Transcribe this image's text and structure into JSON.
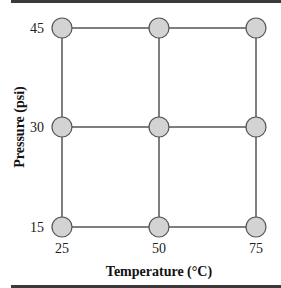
{
  "diagram": {
    "type": "factorial-design-grid",
    "x_axis": {
      "label": "Temperature (°C)",
      "ticks": [
        "25",
        "50",
        "75"
      ]
    },
    "y_axis": {
      "label": "Pressure (psi)",
      "ticks": [
        "15",
        "30",
        "45"
      ]
    },
    "points": [
      {
        "temperature": 25,
        "pressure": 15
      },
      {
        "temperature": 50,
        "pressure": 15
      },
      {
        "temperature": 75,
        "pressure": 15
      },
      {
        "temperature": 25,
        "pressure": 30
      },
      {
        "temperature": 50,
        "pressure": 30
      },
      {
        "temperature": 75,
        "pressure": 30
      },
      {
        "temperature": 25,
        "pressure": 45
      },
      {
        "temperature": 50,
        "pressure": 45
      },
      {
        "temperature": 75,
        "pressure": 45
      }
    ],
    "colors": {
      "node_fill": "#d3d3d3",
      "node_stroke": "#555555",
      "line": "#555555",
      "rule": "#3a3a3a"
    }
  }
}
